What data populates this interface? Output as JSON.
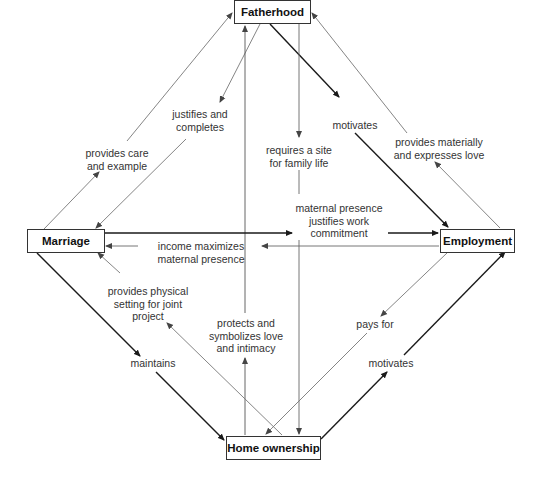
{
  "nodes": {
    "fatherhood": "Fatherhood",
    "marriage": "Marriage",
    "employment": "Employment",
    "home_ownership": "Home ownership"
  },
  "edges": [
    {
      "from": "Marriage",
      "to": "Fatherhood",
      "label": "provides care and example"
    },
    {
      "from": "Fatherhood",
      "to": "Marriage",
      "label": "justifies and completes"
    },
    {
      "from": "Fatherhood",
      "to": "Employment",
      "label": "motivates"
    },
    {
      "from": "Employment",
      "to": "Fatherhood",
      "label": "provides materially and expresses love"
    },
    {
      "from": "Fatherhood",
      "to": "Home ownership",
      "label": "requires a site for family life"
    },
    {
      "from": "Home ownership",
      "to": "Fatherhood",
      "label": "protects and symbolizes love and intimacy"
    },
    {
      "from": "Marriage",
      "to": "Employment",
      "label": "maternal presence justifies work commitment"
    },
    {
      "from": "Employment",
      "to": "Marriage",
      "label": "income maximizes maternal presence"
    },
    {
      "from": "Marriage",
      "to": "Home ownership",
      "label": "maintains"
    },
    {
      "from": "Home ownership",
      "to": "Marriage",
      "label": "provides physical setting for joint project"
    },
    {
      "from": "Employment",
      "to": "Home ownership",
      "label": "pays for"
    },
    {
      "from": "Home ownership",
      "to": "Employment",
      "label": "motivates"
    }
  ],
  "labels": {
    "care_1": "provides care",
    "care_2": "and example",
    "justifies_1": "justifies and",
    "justifies_2": "completes",
    "motivates_top": "motivates",
    "materially_1": "provides materially",
    "materially_2": "and expresses love",
    "site_1": "requires a site",
    "site_2": "for family life",
    "maternal_1": "maternal presence",
    "maternal_2": "justifies work",
    "maternal_3": "commitment",
    "income_1": "income maximizes",
    "income_2": "maternal presence",
    "physical_1": "provides physical",
    "physical_2": "setting for joint",
    "physical_3": "project",
    "protects_1": "protects and",
    "protects_2": "symbolizes love",
    "protects_3": "and intimacy",
    "pays_for": "pays for",
    "maintains": "maintains",
    "motivates_bottom": "motivates"
  },
  "colors": {
    "strong_edge": "#1a1a1a",
    "light_edge": "#777777",
    "box_border": "#333333"
  }
}
